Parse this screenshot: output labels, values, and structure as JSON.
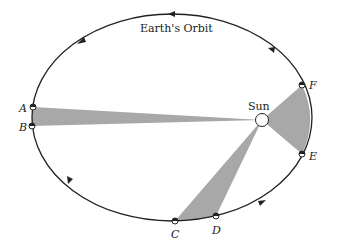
{
  "diagram": {
    "title": "Earth's Orbit",
    "sun_label": "Sun",
    "points": [
      {
        "id": "A",
        "label": "A"
      },
      {
        "id": "B",
        "label": "B"
      },
      {
        "id": "C",
        "label": "C"
      },
      {
        "id": "D",
        "label": "D"
      },
      {
        "id": "E",
        "label": "E"
      },
      {
        "id": "F",
        "label": "F"
      }
    ],
    "colors": {
      "orbit": "#222222",
      "shaded_sector": "#a8a8a8",
      "background": "#ffffff"
    },
    "orbit_direction": "counterclockwise"
  }
}
